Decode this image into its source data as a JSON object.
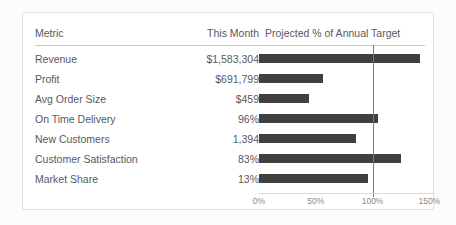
{
  "table": {
    "columns": [
      {
        "key": "metric",
        "label": "Metric"
      },
      {
        "key": "value",
        "label": "This Month"
      },
      {
        "key": "chart",
        "label": "Projected % of  Annual Target"
      }
    ],
    "rows": [
      {
        "metric": "Revenue",
        "value": "$1,583,304",
        "pct": 142
      },
      {
        "metric": "Profit",
        "value": "$691,799",
        "pct": 56
      },
      {
        "metric": "Avg Order Size",
        "value": "$459",
        "pct": 44
      },
      {
        "metric": "On Time Delivery",
        "value": "96%",
        "pct": 105
      },
      {
        "metric": "New Customers",
        "value": "1,394",
        "pct": 85
      },
      {
        "metric": "Customer Satisfaction",
        "value": "83%",
        "pct": 125
      },
      {
        "metric": "Market Share",
        "value": "13%",
        "pct": 96
      }
    ]
  },
  "axis": {
    "ticks": [
      "0%",
      "50%",
      "100%",
      "150%"
    ],
    "tick_values": [
      0,
      50,
      100,
      150
    ],
    "min": 0,
    "max": 155,
    "reference_value": 100
  },
  "colors": {
    "bar": "#404040",
    "reference_line": "#7a7a7a",
    "text": "#58595b",
    "tick_text": "#8a8a8a",
    "rule": "#c8c8c8",
    "card_border": "#e2e2e2",
    "card_background": "#ffffff",
    "page_background": "#fcfcfc"
  },
  "chart_data": {
    "type": "bar",
    "orientation": "horizontal",
    "title": "Projected % of  Annual Target",
    "xlabel": "",
    "ylabel": "",
    "categories": [
      "Revenue",
      "Profit",
      "Avg Order Size",
      "On Time Delivery",
      "New Customers",
      "Customer Satisfaction",
      "Market Share"
    ],
    "values": [
      142,
      56,
      44,
      105,
      85,
      125,
      96
    ],
    "value_labels": [
      "$1,583,304",
      "$691,799",
      "$459",
      "96%",
      "1,394",
      "83%",
      "13%"
    ],
    "xlim": [
      0,
      155
    ],
    "xticks": [
      0,
      50,
      100,
      150
    ],
    "xticklabels": [
      "0%",
      "50%",
      "100%",
      "150%"
    ],
    "grid": false,
    "legend": false,
    "annotations": [
      {
        "type": "vline",
        "value": 100,
        "label": "100% target"
      }
    ]
  }
}
